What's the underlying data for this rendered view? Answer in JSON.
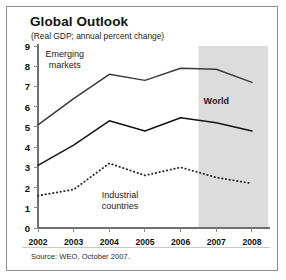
{
  "figure": {
    "title": "Global Outlook",
    "subtitle": "(Real GDP; annual percent change)",
    "source": "Source: WEO, October 2007."
  },
  "chart_data": {
    "type": "line",
    "title": "Global Outlook",
    "subtitle": "(Real GDP; annual percent change)",
    "xlabel": "",
    "ylabel": "",
    "categories": [
      "2002",
      "2003",
      "2004",
      "2005",
      "2006",
      "2007",
      "2008"
    ],
    "x": [
      2002,
      2003,
      2004,
      2005,
      2006,
      2007,
      2008
    ],
    "ylim": [
      0,
      9
    ],
    "yticks": [
      0,
      1,
      2,
      3,
      4,
      5,
      6,
      7,
      8,
      9
    ],
    "grid": false,
    "legend": "inline-annotations",
    "series": [
      {
        "name": "Emerging markets",
        "style": "solid",
        "color": "#3b3b3b",
        "values": [
          5.1,
          6.4,
          7.6,
          7.3,
          7.9,
          7.85,
          7.2
        ]
      },
      {
        "name": "World",
        "style": "solid",
        "color": "#141414",
        "values": [
          3.1,
          4.1,
          5.3,
          4.8,
          5.45,
          5.2,
          4.8
        ]
      },
      {
        "name": "Industrial countries",
        "style": "dotted",
        "color": "#2a2a2a",
        "values": [
          1.6,
          1.9,
          3.2,
          2.6,
          3.0,
          2.5,
          2.2
        ]
      }
    ],
    "annotations": [
      {
        "text": "Emerging\nmarkets",
        "x": 2002.75,
        "y": 8.3,
        "bold": false
      },
      {
        "text": "World",
        "x": 2007.0,
        "y": 6.3,
        "bold": true
      },
      {
        "text": "Industrial\ncountries",
        "x": 2004.3,
        "y": 1.35,
        "bold": false
      }
    ],
    "shaded_region": {
      "label": "forecast",
      "x_start": 2006.5,
      "x_end": 2008.45,
      "color": "#dcdcdc"
    }
  }
}
